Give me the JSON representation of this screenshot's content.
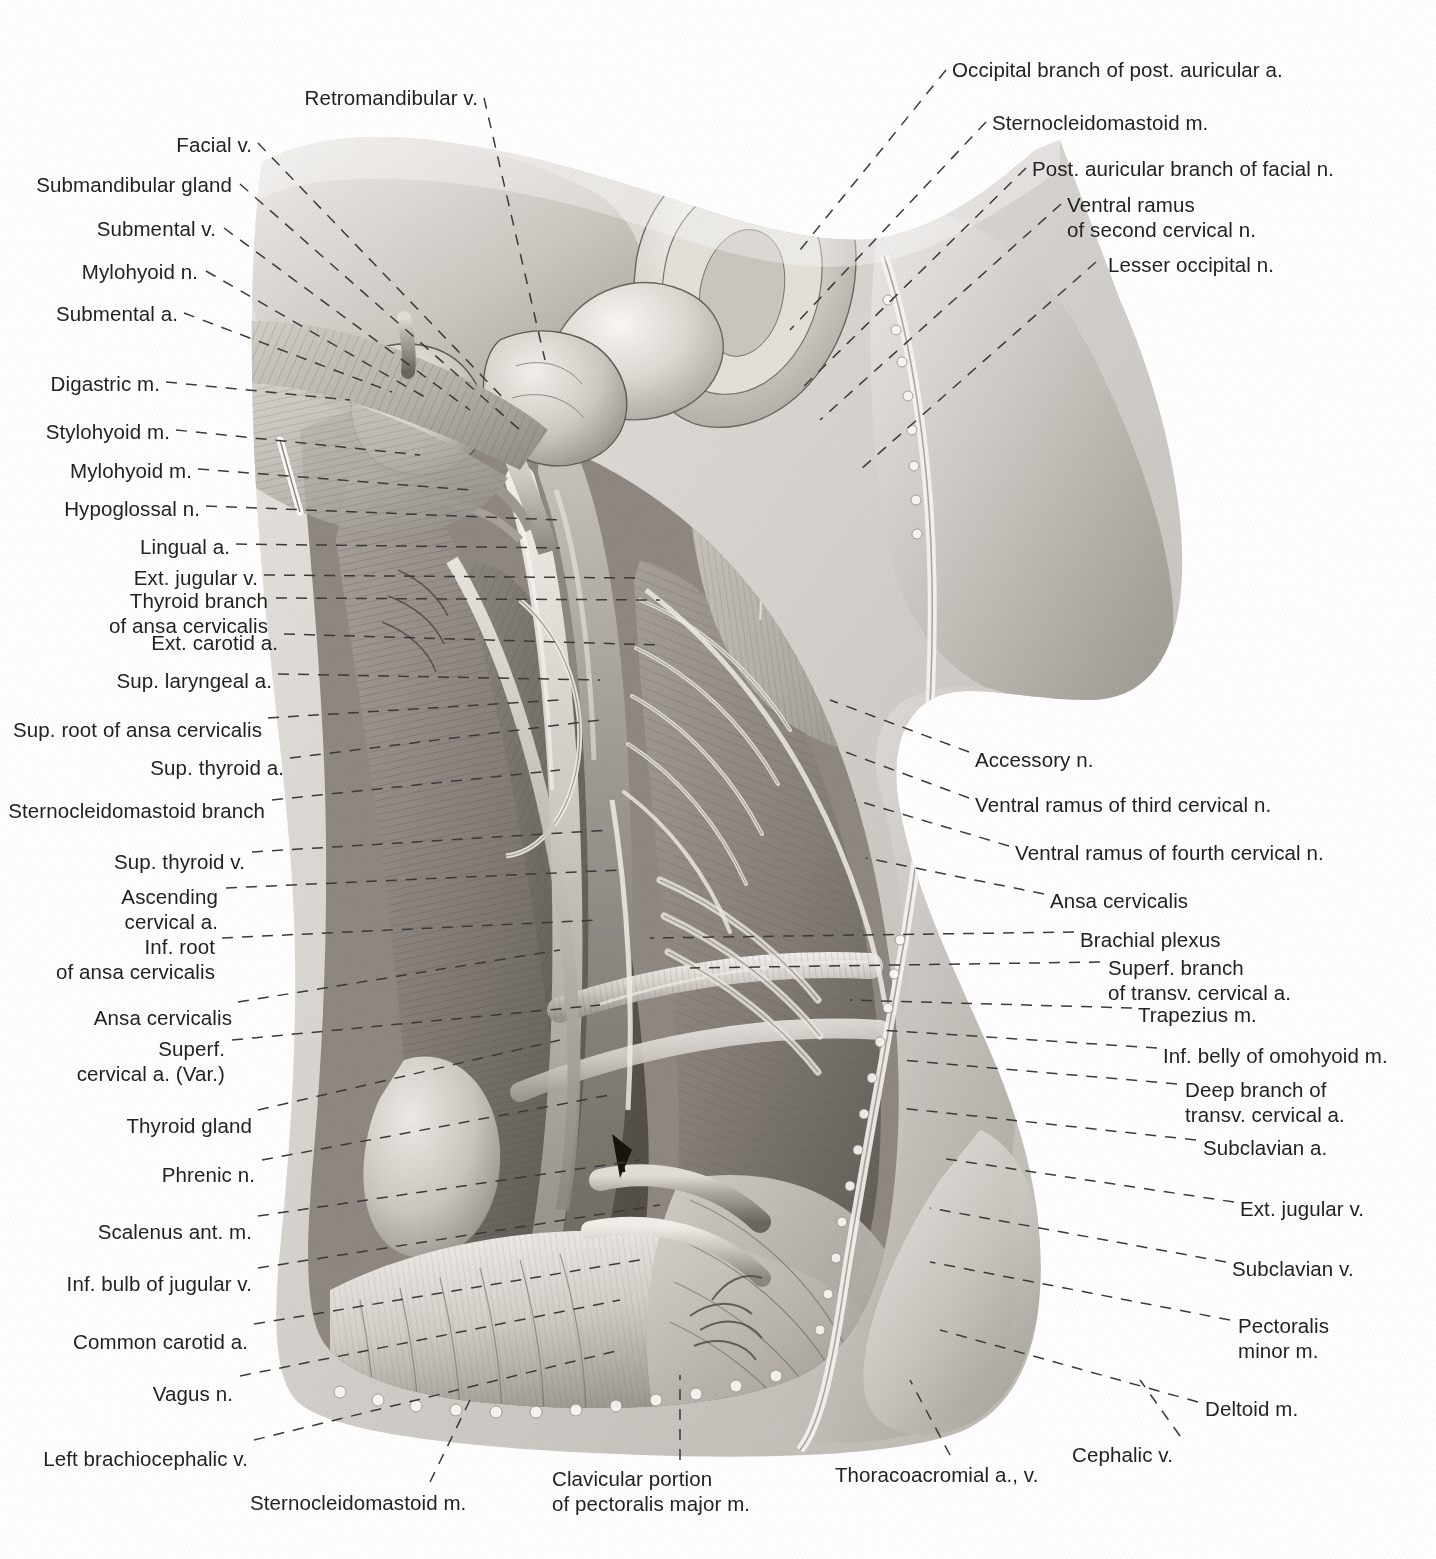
{
  "plate": {
    "title": "Superficial and deep dissection of the lateral neck and root of the neck",
    "background": "#ffffff",
    "ink": "#222222",
    "leader_color": "#3a3a3a"
  },
  "labels_top": [
    {
      "id": "retromandibular-v",
      "text": "Retromandibular v.",
      "align": "right",
      "x": 478,
      "y": 85,
      "leader": [
        [
          484,
          98
        ],
        [
          545,
          360
        ]
      ]
    }
  ],
  "labels_left": [
    {
      "id": "facial-v",
      "text": "Facial v.",
      "align": "right",
      "x": 252,
      "y": 132,
      "leader": [
        [
          258,
          143
        ],
        [
          505,
          400
        ]
      ]
    },
    {
      "id": "submandibular-gland",
      "text": "Submandibular gland",
      "align": "right",
      "x": 232,
      "y": 172,
      "leader": [
        [
          240,
          184
        ],
        [
          520,
          430
        ]
      ]
    },
    {
      "id": "submental-v",
      "text": "Submental v.",
      "align": "right",
      "x": 216,
      "y": 216,
      "leader": [
        [
          224,
          228
        ],
        [
          470,
          410
        ]
      ]
    },
    {
      "id": "mylohyoid-n",
      "text": "Mylohyoid n.",
      "align": "right",
      "x": 198,
      "y": 259,
      "leader": [
        [
          206,
          271
        ],
        [
          430,
          400
        ]
      ]
    },
    {
      "id": "submental-a",
      "text": "Submental a.",
      "align": "right",
      "x": 178,
      "y": 301,
      "leader": [
        [
          184,
          313
        ],
        [
          392,
          392
        ]
      ]
    },
    {
      "id": "digastric-m",
      "text": "Digastric m.",
      "align": "right",
      "x": 160,
      "y": 371,
      "leader": [
        [
          166,
          382
        ],
        [
          350,
          400
        ]
      ]
    },
    {
      "id": "stylohyoid-m",
      "text": "Stylohyoid m.",
      "align": "right",
      "x": 170,
      "y": 419,
      "leader": [
        [
          176,
          430
        ],
        [
          420,
          455
        ]
      ]
    },
    {
      "id": "mylohyoid-m",
      "text": "Mylohyoid m.",
      "align": "right",
      "x": 192,
      "y": 458,
      "leader": [
        [
          198,
          469
        ],
        [
          470,
          490
        ]
      ]
    },
    {
      "id": "hypoglossal-n",
      "text": "Hypoglossal n.",
      "align": "right",
      "x": 200,
      "y": 496,
      "leader": [
        [
          206,
          506
        ],
        [
          560,
          520
        ]
      ]
    },
    {
      "id": "lingual-a",
      "text": "Lingual a.",
      "align": "right",
      "x": 230,
      "y": 534,
      "leader": [
        [
          236,
          544
        ],
        [
          560,
          548
        ]
      ]
    },
    {
      "id": "ext-jugular-v-upper",
      "text": "Ext. jugular v.",
      "align": "right",
      "x": 258,
      "y": 565,
      "leader": [
        [
          264,
          575
        ],
        [
          640,
          578
        ]
      ]
    },
    {
      "id": "thyroid-branch-ansa",
      "text": "Thyroid branch\nof ansa cervicalis",
      "align": "right",
      "x": 268,
      "y": 588,
      "leader": [
        [
          276,
          598
        ],
        [
          660,
          600
        ]
      ]
    },
    {
      "id": "ext-carotid-a",
      "text": "Ext. carotid a.",
      "align": "right",
      "x": 278,
      "y": 630,
      "leader": [
        [
          284,
          634
        ],
        [
          660,
          645
        ]
      ]
    },
    {
      "id": "sup-laryngeal-a",
      "text": "Sup. laryngeal a.",
      "align": "right",
      "x": 272,
      "y": 668,
      "leader": [
        [
          278,
          674
        ],
        [
          600,
          680
        ]
      ]
    },
    {
      "id": "sup-root-ansa-cervicalis",
      "text": "Sup. root of ansa cervicalis",
      "align": "right",
      "x": 262,
      "y": 717,
      "leader": [
        [
          268,
          718
        ],
        [
          560,
          700
        ]
      ]
    },
    {
      "id": "sup-thyroid-a",
      "text": "Sup. thyroid a.",
      "align": "right",
      "x": 284,
      "y": 755,
      "leader": [
        [
          290,
          758
        ],
        [
          600,
          720
        ]
      ]
    },
    {
      "id": "sternocleidomastoid-branch",
      "text": "Sternocleidomastoid branch",
      "align": "right",
      "x": 265,
      "y": 798,
      "leader": [
        [
          272,
          800
        ],
        [
          560,
          770
        ]
      ]
    },
    {
      "id": "sup-thyroid-v",
      "text": "Sup. thyroid v.",
      "align": "right",
      "x": 245,
      "y": 849,
      "leader": [
        [
          252,
          852
        ],
        [
          610,
          830
        ]
      ]
    },
    {
      "id": "ascending-cervical-a",
      "text": "Ascending\ncervical a.",
      "align": "right",
      "x": 218,
      "y": 884,
      "leader": [
        [
          226,
          888
        ],
        [
          620,
          870
        ]
      ]
    },
    {
      "id": "inf-root-ansa-cervicalis",
      "text": "Inf. root\nof ansa cervicalis",
      "align": "right",
      "x": 215,
      "y": 934,
      "leader": [
        [
          222,
          938
        ],
        [
          600,
          920
        ]
      ]
    },
    {
      "id": "ansa-cervicalis-left",
      "text": "Ansa cervicalis",
      "align": "right",
      "x": 232,
      "y": 1005,
      "leader": [
        [
          238,
          1002
        ],
        [
          560,
          950
        ]
      ]
    },
    {
      "id": "superf-cervical-a-var",
      "text": "Superf.\ncervical a. (Var.)",
      "align": "right",
      "x": 225,
      "y": 1036,
      "leader": [
        [
          232,
          1040
        ],
        [
          600,
          1005
        ]
      ]
    },
    {
      "id": "thyroid-gland",
      "text": "Thyroid gland",
      "align": "right",
      "x": 252,
      "y": 1113,
      "leader": [
        [
          258,
          1110
        ],
        [
          560,
          1040
        ]
      ]
    },
    {
      "id": "phrenic-n",
      "text": "Phrenic n.",
      "align": "right",
      "x": 255,
      "y": 1162,
      "leader": [
        [
          262,
          1160
        ],
        [
          610,
          1095
        ]
      ]
    },
    {
      "id": "scalenus-ant-m",
      "text": "Scalenus ant. m.",
      "align": "right",
      "x": 252,
      "y": 1219,
      "leader": [
        [
          258,
          1216
        ],
        [
          640,
          1160
        ]
      ]
    },
    {
      "id": "inf-bulb-of-jugular-v",
      "text": "Inf. bulb of jugular v.",
      "align": "right",
      "x": 252,
      "y": 1271,
      "leader": [
        [
          258,
          1268
        ],
        [
          660,
          1205
        ]
      ]
    },
    {
      "id": "common-carotid-a",
      "text": "Common carotid a.",
      "align": "right",
      "x": 248,
      "y": 1329,
      "leader": [
        [
          254,
          1324
        ],
        [
          640,
          1260
        ]
      ]
    },
    {
      "id": "vagus-n",
      "text": "Vagus n.",
      "align": "right",
      "x": 233,
      "y": 1381,
      "leader": [
        [
          240,
          1376
        ],
        [
          620,
          1300
        ]
      ]
    },
    {
      "id": "left-brachiocephalic-v",
      "text": "Left brachiocephalic v.",
      "align": "right",
      "x": 248,
      "y": 1446,
      "leader": [
        [
          254,
          1440
        ],
        [
          620,
          1350
        ]
      ]
    }
  ],
  "labels_right": [
    {
      "id": "occipital-branch-post-auricular-a",
      "text": "Occipital branch of post. auricular a.",
      "align": "left",
      "x": 952,
      "y": 57,
      "leader": [
        [
          946,
          70
        ],
        [
          800,
          250
        ]
      ]
    },
    {
      "id": "sternocleidomastoid-m-top",
      "text": "Sternocleidomastoid m.",
      "align": "left",
      "x": 992,
      "y": 110,
      "leader": [
        [
          986,
          122
        ],
        [
          790,
          330
        ]
      ]
    },
    {
      "id": "post-auricular-branch-facial-n",
      "text": "Post. auricular branch of facial n.",
      "align": "left",
      "x": 1032,
      "y": 156,
      "leader": [
        [
          1026,
          168
        ],
        [
          800,
          390
        ]
      ]
    },
    {
      "id": "ventral-ramus-second-cervical-n",
      "text": "Ventral ramus\nof second cervical n.",
      "align": "left",
      "x": 1067,
      "y": 192,
      "leader": [
        [
          1061,
          204
        ],
        [
          820,
          420
        ]
      ]
    },
    {
      "id": "lesser-occipital-n",
      "text": "Lesser occipital n.",
      "align": "left",
      "x": 1108,
      "y": 252,
      "leader": [
        [
          1096,
          262
        ],
        [
          860,
          470
        ]
      ]
    },
    {
      "id": "accessory-n",
      "text": "Accessory n.",
      "align": "left",
      "x": 975,
      "y": 747,
      "leader": [
        [
          969,
          752
        ],
        [
          830,
          700
        ]
      ]
    },
    {
      "id": "ventral-ramus-third-cervical-n",
      "text": "Ventral ramus of third cervical n.",
      "align": "left",
      "x": 975,
      "y": 792,
      "leader": [
        [
          969,
          798
        ],
        [
          840,
          750
        ]
      ]
    },
    {
      "id": "ventral-ramus-fourth-cervical-n",
      "text": "Ventral ramus of fourth cervical n.",
      "align": "left",
      "x": 1015,
      "y": 840,
      "leader": [
        [
          1009,
          846
        ],
        [
          855,
          800
        ]
      ]
    },
    {
      "id": "ansa-cervicalis-right",
      "text": "Ansa cervicalis",
      "align": "left",
      "x": 1050,
      "y": 888,
      "leader": [
        [
          1044,
          894
        ],
        [
          866,
          858
        ]
      ]
    },
    {
      "id": "brachial-plexus",
      "text": "Brachial plexus",
      "align": "left",
      "x": 1080,
      "y": 927,
      "leader": [
        [
          1074,
          932
        ],
        [
          650,
          938
        ]
      ]
    },
    {
      "id": "superf-branch-transv-cervical-a",
      "text": "Superf. branch\nof transv. cervical a.",
      "align": "left",
      "x": 1108,
      "y": 955,
      "leader": [
        [
          1100,
          962
        ],
        [
          690,
          968
        ]
      ]
    },
    {
      "id": "trapezius-m",
      "text": "Trapezius m.",
      "align": "left",
      "x": 1138,
      "y": 1002,
      "leader": [
        [
          1132,
          1008
        ],
        [
          850,
          1000
        ]
      ]
    },
    {
      "id": "inf-belly-omohyoid-m",
      "text": "Inf. belly of omohyoid m.",
      "align": "left",
      "x": 1163,
      "y": 1043,
      "leader": [
        [
          1157,
          1048
        ],
        [
          880,
          1030
        ]
      ]
    },
    {
      "id": "deep-branch-transv-cervical-a",
      "text": "Deep branch of\ntransv. cervical a.",
      "align": "left",
      "x": 1185,
      "y": 1077,
      "leader": [
        [
          1177,
          1084
        ],
        [
          900,
          1060
        ]
      ]
    },
    {
      "id": "subclavian-a",
      "text": "Subclavian a.",
      "align": "left",
      "x": 1203,
      "y": 1135,
      "leader": [
        [
          1196,
          1140
        ],
        [
          900,
          1108
        ]
      ]
    },
    {
      "id": "ext-jugular-v-lower",
      "text": "Ext. jugular v.",
      "align": "left",
      "x": 1240,
      "y": 1196,
      "leader": [
        [
          1234,
          1202
        ],
        [
          940,
          1158
        ]
      ]
    },
    {
      "id": "subclavian-v",
      "text": "Subclavian v.",
      "align": "left",
      "x": 1232,
      "y": 1256,
      "leader": [
        [
          1226,
          1262
        ],
        [
          930,
          1208
        ]
      ]
    },
    {
      "id": "pectoralis-minor-m",
      "text": "Pectoralis\nminor m.",
      "align": "left",
      "x": 1238,
      "y": 1313,
      "leader": [
        [
          1230,
          1320
        ],
        [
          930,
          1262
        ]
      ]
    },
    {
      "id": "deltoid-m",
      "text": "Deltoid m.",
      "align": "left",
      "x": 1205,
      "y": 1396,
      "leader": [
        [
          1198,
          1402
        ],
        [
          940,
          1330
        ]
      ]
    }
  ],
  "labels_bottom": [
    {
      "id": "sternocleidomastoid-m-bottom",
      "text": "Sternocleidomastoid m.",
      "align": "left",
      "x": 250,
      "y": 1490,
      "leader": [
        [
          430,
          1482
        ],
        [
          470,
          1400
        ]
      ]
    },
    {
      "id": "clavicular-portion-pectoralis-major-m",
      "text": "Clavicular portion\nof pectoralis major m.",
      "align": "left",
      "x": 552,
      "y": 1466,
      "leader": [
        [
          680,
          1460
        ],
        [
          680,
          1375
        ]
      ]
    },
    {
      "id": "thoracoacromial-a-v",
      "text": "Thoracoacromial a., v.",
      "align": "left",
      "x": 835,
      "y": 1462,
      "leader": [
        [
          950,
          1455
        ],
        [
          910,
          1380
        ]
      ]
    },
    {
      "id": "cephalic-v",
      "text": "Cephalic v.",
      "align": "left",
      "x": 1072,
      "y": 1442,
      "leader": [
        [
          1180,
          1436
        ],
        [
          1140,
          1380
        ]
      ]
    }
  ]
}
